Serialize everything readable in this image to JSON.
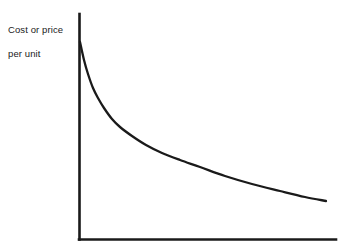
{
  "figure": {
    "background_color": "#ffffff",
    "line_color": "#1a1a1a",
    "width": 347,
    "height": 252
  },
  "labels": {
    "y_axis_line1": "Cost or price",
    "y_axis_line2": "per unit",
    "x_axis_clipped": ""
  },
  "chart_data": {
    "type": "line",
    "title": "",
    "subtitle": "",
    "xlabel": "",
    "ylabel": "Cost or price per unit",
    "legend": [],
    "legend_position": "none",
    "grid": false,
    "axis_style": "two-axis-spine (left and bottom only, no ticks, no tick labels)",
    "xlim": [
      0,
      1
    ],
    "ylim": [
      0,
      1
    ],
    "x_tick_labels": [],
    "y_tick_labels": [],
    "annotations": [],
    "series": [
      {
        "name": "Cost or price per unit",
        "description": "Steeply decaying convex curve (experience/learning curve): very high at low volume, falling rapidly then flattening toward a shallow decline.",
        "color": "#1a1a1a",
        "x": [
          0.0,
          0.03,
          0.06,
          0.1,
          0.14,
          0.16,
          0.24,
          0.31,
          0.39,
          0.47,
          0.55,
          0.63,
          0.71,
          0.79,
          0.88,
          0.96
        ],
        "y": [
          0.88,
          0.74,
          0.63,
          0.54,
          0.5,
          0.48,
          0.43,
          0.39,
          0.35,
          0.32,
          0.29,
          0.26,
          0.24,
          0.21,
          0.19,
          0.17
        ]
      }
    ],
    "pixel_geometry": {
      "y_axis_x": 79,
      "y_axis_top_y": 14,
      "x_axis_y": 239,
      "x_axis_right_x": 336,
      "curve_points": [
        [
          80,
          42
        ],
        [
          84,
          60
        ],
        [
          88,
          74
        ],
        [
          93,
          88
        ],
        [
          98,
          98
        ],
        [
          104,
          108
        ],
        [
          112,
          119
        ],
        [
          120,
          127
        ],
        [
          132,
          136
        ],
        [
          146,
          145
        ],
        [
          162,
          153
        ],
        [
          180,
          160
        ],
        [
          200,
          167
        ],
        [
          225,
          176
        ],
        [
          252,
          184
        ],
        [
          280,
          191
        ],
        [
          305,
          197
        ],
        [
          326,
          201
        ]
      ]
    }
  }
}
